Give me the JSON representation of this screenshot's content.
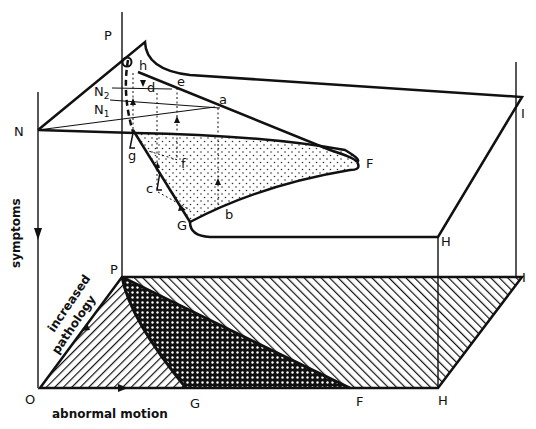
{
  "figure": {
    "type": "cusp catastrophe diagram",
    "ink_color": "#111111",
    "background": "#ffffff",
    "axes": {
      "vertical_label": "symptoms",
      "diagonal_label_line1": "increased",
      "diagonal_label_line2": "pathology",
      "horizontal_label": "abnormal motion"
    },
    "surface_points": {
      "P_top": "P",
      "N": "N",
      "N1": "N",
      "N1_sub": "1",
      "N2": "N",
      "N2_sub": "2",
      "h": "h",
      "d": "d",
      "e": "e",
      "a": "a",
      "g": "g",
      "f": "f",
      "c": "c",
      "b": "b",
      "F_top": "F",
      "G_top": "G",
      "H_top": "H",
      "I_top": "I"
    },
    "base_points": {
      "P": "P",
      "O": "O",
      "G": "G",
      "F": "F",
      "H": "H",
      "I": "I"
    },
    "regions": [
      {
        "name": "normal region O-P-G",
        "pattern": "diagonal-hatch-right"
      },
      {
        "name": "bimodal region P-G-F",
        "pattern": "cross-hatch-dense"
      },
      {
        "name": "pathological region P-F-H-I",
        "pattern": "diagonal-hatch-left"
      },
      {
        "name": "fold (inaccessible) region g-F-G",
        "pattern": "stippled"
      }
    ]
  }
}
